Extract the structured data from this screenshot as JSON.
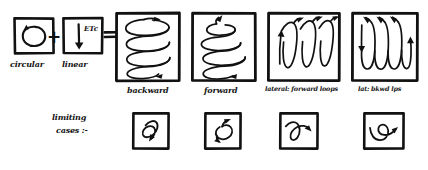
{
  "diagram": {
    "title_text": "circular + linear motion combination chart",
    "operators": {
      "plus": "+",
      "equals": "="
    },
    "sources": [
      {
        "id": "circular",
        "label": "circular",
        "icon": "circular-arrow-icon"
      },
      {
        "id": "linear",
        "label": "linear",
        "icon": "down-arrow-icon",
        "annotation": "ETc"
      }
    ],
    "results": [
      {
        "id": "backward",
        "label": "backward",
        "icon": "descending-helix-icon"
      },
      {
        "id": "forward",
        "label": "forward",
        "icon": "ascending-spiral-icon"
      },
      {
        "id": "lateral-fwd",
        "label": "lateral: forward loops",
        "icon": "vertical-loops-up-icon"
      },
      {
        "id": "lateral-bkwd",
        "label": "lat: bkwd lps",
        "icon": "vertical-loops-down-icon"
      }
    ],
    "limiting": {
      "label_line1": "limiting",
      "label_line2": "cases :-",
      "cases": [
        {
          "id": "case-1",
          "icon": "loop-down-tail-icon"
        },
        {
          "id": "case-2",
          "icon": "loop-up-arrow-icon"
        },
        {
          "id": "case-3",
          "icon": "loop-right-arrow-icon"
        },
        {
          "id": "case-4",
          "icon": "loop-swoop-right-icon"
        }
      ]
    },
    "colors": {
      "ink": "#111111",
      "paper": "#ffffff"
    }
  }
}
